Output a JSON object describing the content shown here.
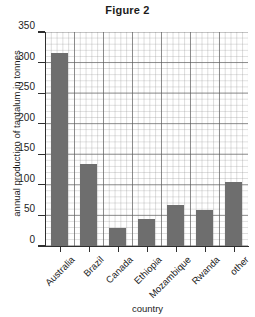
{
  "chart_data": {
    "type": "bar",
    "title": "Figure 2",
    "xlabel": "country",
    "ylabel": "annual production of tantalum in tonnes",
    "categories": [
      "Australia",
      "Brazil",
      "Canada",
      "Ethiopia",
      "Mozambique",
      "Rwanda",
      "other"
    ],
    "values": [
      315,
      134,
      29,
      44,
      67,
      59,
      105
    ],
    "ylim": [
      0,
      350
    ],
    "ytick_labels": [
      "0",
      "50",
      "100",
      "150",
      "200",
      "250",
      "300",
      "350"
    ],
    "ytick_values": [
      0,
      50,
      100,
      150,
      200,
      250,
      300,
      350
    ],
    "grid": true,
    "minor_grid": true,
    "legend": "none",
    "bar_color": "#6e6e6e",
    "axis_color": "#2f2f2f",
    "grid_color": "#8c8c8c",
    "background": "#ffffff"
  }
}
